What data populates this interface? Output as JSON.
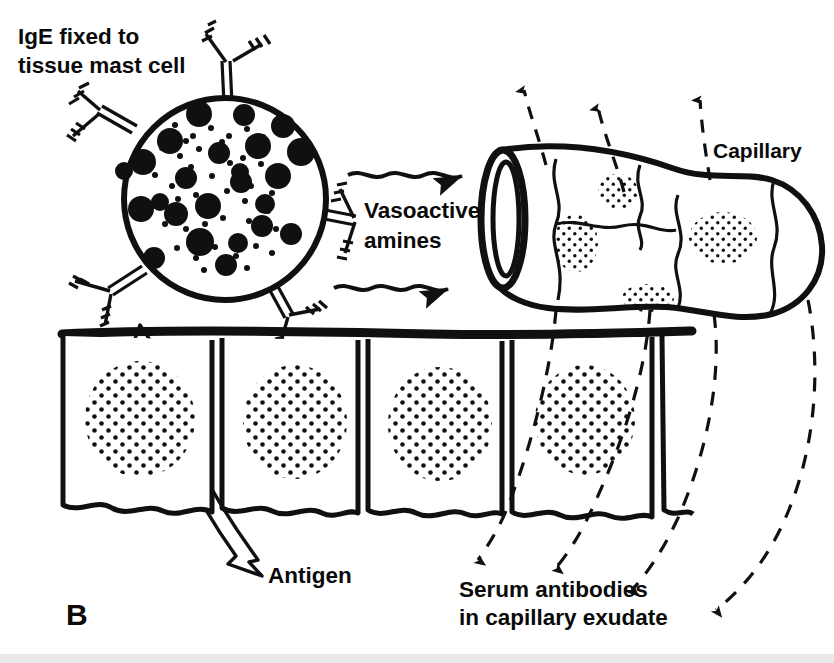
{
  "figure": {
    "panel_label": "B",
    "title_label": "IgE fixed to\ntissue mast cell",
    "title_line1": "IgE fixed to",
    "title_line2": "tissue mast cell",
    "vasoactive_line1": "Vasoactive",
    "vasoactive_line2": "amines",
    "capillary_label": "Capillary",
    "antigen_label": "Antigen",
    "serum_line1": "Serum antibodies",
    "serum_line2": "in capillary exudate",
    "ink_color": "#101010",
    "background_color": "#ffffff"
  },
  "structures": {
    "mast_cell": {
      "name": "tissue mast cell",
      "center_x": 225,
      "center_y": 199,
      "radius": 101,
      "granule_count": 24,
      "ige_receptor_count": 5
    },
    "capillary": {
      "name": "capillary",
      "endothelial_nuclei": 4,
      "efflux_arrows_up": 3,
      "exudate_arrows_down": 4
    },
    "epithelium": {
      "name": "epithelial cell layer",
      "cell_count": 4,
      "top_y": 331,
      "bottom_y": 519
    }
  },
  "chart_data": {
    "type": "diagram",
    "elements": [
      "IgE fixed to tissue mast cell",
      "Antigen",
      "Vasoactive amines",
      "Capillary",
      "Serum antibodies in capillary exudate"
    ],
    "granules": [
      {
        "cx": 199,
        "cy": 114,
        "r": 13
      },
      {
        "cx": 244,
        "cy": 115,
        "r": 11
      },
      {
        "cx": 283,
        "cy": 126,
        "r": 12
      },
      {
        "cx": 170,
        "cy": 141,
        "r": 13
      },
      {
        "cx": 219,
        "cy": 153,
        "r": 11
      },
      {
        "cx": 258,
        "cy": 146,
        "r": 13
      },
      {
        "cx": 301,
        "cy": 152,
        "r": 14
      },
      {
        "cx": 143,
        "cy": 162,
        "r": 13
      },
      {
        "cx": 124,
        "cy": 171,
        "r": 9
      },
      {
        "cx": 186,
        "cy": 178,
        "r": 11
      },
      {
        "cx": 240,
        "cy": 172,
        "r": 9
      },
      {
        "cx": 241,
        "cy": 182,
        "r": 11
      },
      {
        "cx": 278,
        "cy": 176,
        "r": 13
      },
      {
        "cx": 160,
        "cy": 202,
        "r": 9
      },
      {
        "cx": 208,
        "cy": 206,
        "r": 13
      },
      {
        "cx": 265,
        "cy": 204,
        "r": 10
      },
      {
        "cx": 141,
        "cy": 209,
        "r": 13
      },
      {
        "cx": 176,
        "cy": 214,
        "r": 12
      },
      {
        "cx": 262,
        "cy": 226,
        "r": 11
      },
      {
        "cx": 200,
        "cy": 242,
        "r": 14
      },
      {
        "cx": 238,
        "cy": 243,
        "r": 10
      },
      {
        "cx": 291,
        "cy": 234,
        "r": 11
      },
      {
        "cx": 154,
        "cy": 258,
        "r": 11
      },
      {
        "cx": 226,
        "cy": 265,
        "r": 11
      }
    ]
  }
}
